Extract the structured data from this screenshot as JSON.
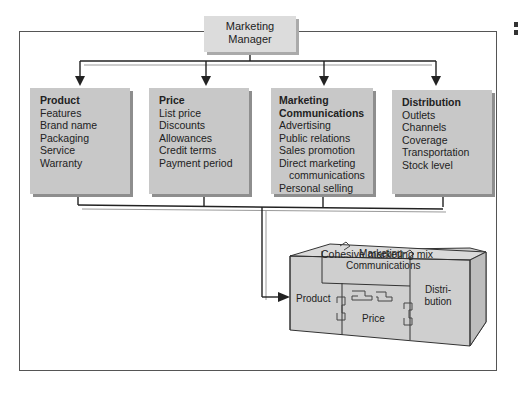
{
  "diagram": {
    "manager": {
      "line1": "Marketing",
      "line2": "Manager"
    },
    "boxes": [
      {
        "title": "Product",
        "items": [
          "Features",
          "Brand name",
          "Packaging",
          "Service",
          "Warranty"
        ]
      },
      {
        "title": "Price",
        "items": [
          "List price",
          "Discounts",
          "Allowances",
          "Credit terms",
          "Payment period"
        ]
      },
      {
        "title_line1": "Marketing",
        "title_line2": "Communications",
        "items": [
          "Advertising",
          "Public relations",
          "Sales promotion",
          "Direct marketing",
          "communications",
          "Personal selling"
        ]
      },
      {
        "title": "Distribution",
        "items": [
          "Outlets",
          "Channels",
          "Coverage",
          "Transportation",
          "Stock level"
        ]
      }
    ],
    "caption": "Cohesive marketing mix",
    "cube": {
      "top_label_1": "Marketing",
      "top_label_2": "Communications",
      "product": "Product",
      "price": "Price",
      "distribution_1": "Distri-",
      "distribution_2": "bution"
    },
    "colors": {
      "box_fill": "#c8c8c8",
      "shadow": "#8e8e8e",
      "line": "#222222",
      "line_light": "#9a9a9a"
    }
  }
}
